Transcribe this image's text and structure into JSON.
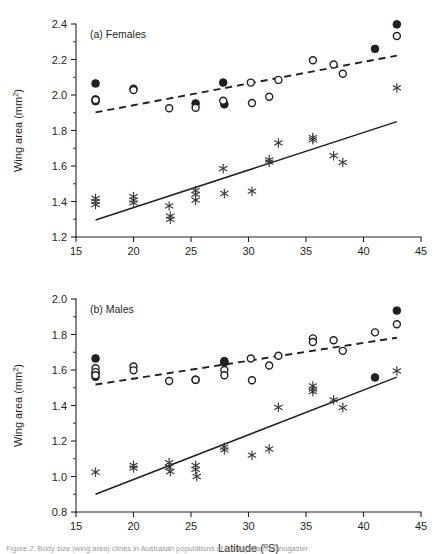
{
  "figure": {
    "xlabel": "Latitude (°S)",
    "ylabel_main": "Wing area (mm",
    "ylabel_sup": "2",
    "ylabel_close": ")",
    "caption": "Figure 2. Body size (wing area) clines in Australian populations of Drosophila melanogaster"
  },
  "chart_data": [
    {
      "type": "scatter",
      "panel": "a",
      "title": "(a) Females",
      "xlabel": "Latitude (°S)",
      "ylabel": "Wing area (mm2)",
      "xlim": [
        15,
        45
      ],
      "ylim": [
        1.2,
        2.4
      ],
      "xticks": [
        15,
        20,
        25,
        30,
        35,
        40,
        45
      ],
      "yticks": [
        1.2,
        1.4,
        1.6,
        1.8,
        2.0,
        2.2,
        2.4
      ],
      "grid": false,
      "legend": "none",
      "series": [
        {
          "name": "filled-circle",
          "marker": "filled circle",
          "points": [
            [
              16.7,
              2.065
            ],
            [
              16.7,
              1.975
            ],
            [
              16.7,
              1.965
            ],
            [
              25.4,
              1.952
            ],
            [
              27.8,
              2.07
            ],
            [
              27.9,
              1.948
            ],
            [
              41.0,
              2.26
            ],
            [
              42.9,
              2.398
            ]
          ]
        },
        {
          "name": "open-circle",
          "marker": "open circle",
          "points": [
            [
              16.7,
              1.972
            ],
            [
              20.0,
              2.035
            ],
            [
              20.0,
              2.028
            ],
            [
              23.1,
              1.925
            ],
            [
              25.4,
              1.928
            ],
            [
              27.8,
              1.968
            ],
            [
              30.2,
              2.07
            ],
            [
              30.3,
              1.955
            ],
            [
              31.8,
              1.99
            ],
            [
              32.6,
              2.085
            ],
            [
              35.6,
              2.196
            ],
            [
              37.4,
              2.172
            ],
            [
              38.2,
              2.12
            ],
            [
              42.9,
              2.332
            ]
          ]
        },
        {
          "name": "asterisk",
          "marker": "asterisk",
          "points": [
            [
              16.7,
              1.418
            ],
            [
              16.7,
              1.4
            ],
            [
              16.7,
              1.382
            ],
            [
              20.0,
              1.428
            ],
            [
              20.0,
              1.408
            ],
            [
              20.0,
              1.392
            ],
            [
              23.1,
              1.375
            ],
            [
              23.2,
              1.318
            ],
            [
              23.2,
              1.3
            ],
            [
              25.4,
              1.462
            ],
            [
              25.4,
              1.44
            ],
            [
              25.4,
              1.408
            ],
            [
              27.8,
              1.585
            ],
            [
              27.9,
              1.445
            ],
            [
              30.3,
              1.458
            ],
            [
              31.8,
              1.635
            ],
            [
              31.8,
              1.622
            ],
            [
              32.6,
              1.73
            ],
            [
              35.6,
              1.76
            ],
            [
              35.6,
              1.748
            ],
            [
              37.4,
              1.658
            ],
            [
              38.2,
              1.62
            ],
            [
              42.9,
              2.04
            ]
          ]
        }
      ],
      "fit_lines": [
        {
          "name": "dashed-regression",
          "style": "dashed",
          "x": [
            16.7,
            42.9
          ],
          "y": [
            1.902,
            2.222
          ]
        },
        {
          "name": "solid-regression",
          "style": "solid",
          "x": [
            16.7,
            42.9
          ],
          "y": [
            1.296,
            1.85
          ]
        }
      ]
    },
    {
      "type": "scatter",
      "panel": "b",
      "title": "(b) Males",
      "xlabel": "Latitude (°S)",
      "ylabel": "Wing area (mm2)",
      "xlim": [
        15,
        45
      ],
      "ylim": [
        0.8,
        2.0
      ],
      "xticks": [
        15,
        20,
        25,
        30,
        35,
        40,
        45
      ],
      "yticks": [
        0.8,
        1.0,
        1.2,
        1.4,
        1.6,
        1.8,
        2.0
      ],
      "grid": false,
      "legend": "none",
      "series": [
        {
          "name": "filled-circle",
          "marker": "filled circle",
          "points": [
            [
              16.7,
              1.665
            ],
            [
              16.7,
              1.585
            ],
            [
              16.7,
              1.562
            ],
            [
              25.4,
              1.545
            ],
            [
              27.9,
              1.65
            ],
            [
              27.9,
              1.643
            ],
            [
              41.0,
              1.558
            ],
            [
              42.9,
              1.935
            ]
          ]
        },
        {
          "name": "open-circle",
          "marker": "open circle",
          "points": [
            [
              16.7,
              1.61
            ],
            [
              16.7,
              1.588
            ],
            [
              16.7,
              1.57
            ],
            [
              20.0,
              1.62
            ],
            [
              20.0,
              1.598
            ],
            [
              23.1,
              1.538
            ],
            [
              25.4,
              1.545
            ],
            [
              27.9,
              1.6
            ],
            [
              27.9,
              1.57
            ],
            [
              30.2,
              1.665
            ],
            [
              30.3,
              1.542
            ],
            [
              31.8,
              1.625
            ],
            [
              32.6,
              1.68
            ],
            [
              35.6,
              1.778
            ],
            [
              35.6,
              1.758
            ],
            [
              37.4,
              1.768
            ],
            [
              38.2,
              1.708
            ],
            [
              41.0,
              1.812
            ],
            [
              42.9,
              1.858
            ]
          ]
        },
        {
          "name": "asterisk",
          "marker": "asterisk",
          "points": [
            [
              16.7,
              1.025
            ],
            [
              20.0,
              1.062
            ],
            [
              20.0,
              1.048
            ],
            [
              23.1,
              1.078
            ],
            [
              23.1,
              1.052
            ],
            [
              23.2,
              1.028
            ],
            [
              25.4,
              1.062
            ],
            [
              25.4,
              1.04
            ],
            [
              25.5,
              1.0
            ],
            [
              27.9,
              1.165
            ],
            [
              27.9,
              1.15
            ],
            [
              30.3,
              1.12
            ],
            [
              31.8,
              1.155
            ],
            [
              32.6,
              1.39
            ],
            [
              35.6,
              1.51
            ],
            [
              35.6,
              1.492
            ],
            [
              35.6,
              1.478
            ],
            [
              37.4,
              1.432
            ],
            [
              38.2,
              1.388
            ],
            [
              42.9,
              1.595
            ]
          ]
        }
      ],
      "fit_lines": [
        {
          "name": "dashed-regression",
          "style": "dashed",
          "x": [
            16.7,
            42.9
          ],
          "y": [
            1.518,
            1.782
          ]
        },
        {
          "name": "solid-regression",
          "style": "solid",
          "x": [
            16.7,
            42.9
          ],
          "y": [
            0.9,
            1.56
          ]
        }
      ]
    }
  ]
}
